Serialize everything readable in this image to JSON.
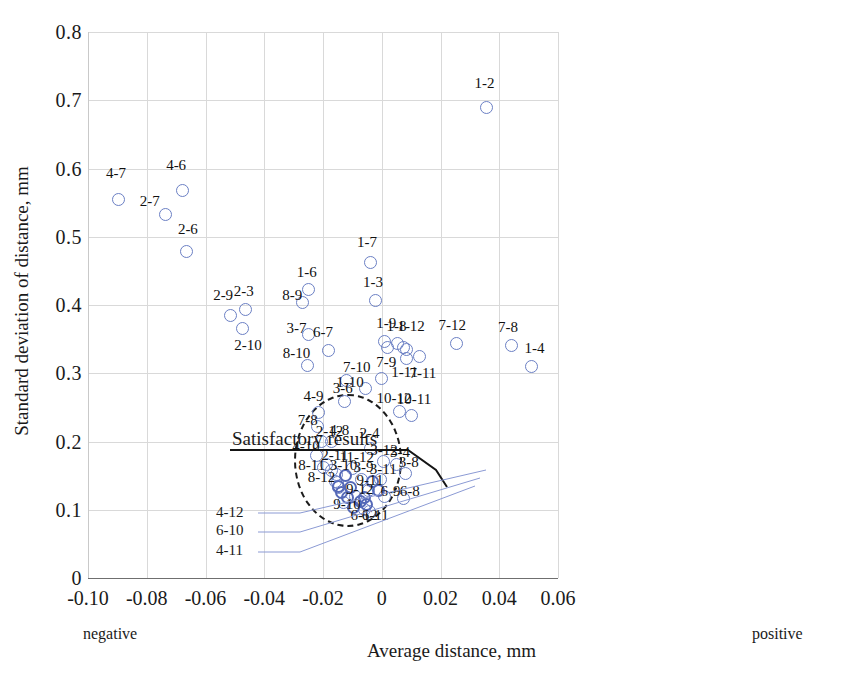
{
  "chart_data": {
    "type": "scatter",
    "title": "",
    "xlabel": "Average distance, mm",
    "ylabel": "Standard deviation of distance, mm",
    "xlim": [
      -0.1,
      0.06
    ],
    "ylim": [
      0,
      0.8
    ],
    "xticks": [
      "-0.10",
      "-0.08",
      "-0.06",
      "-0.04",
      "-0.02",
      "0",
      "0.02",
      "0.04",
      "0.06"
    ],
    "xtick_values": [
      -0.1,
      -0.08,
      -0.06,
      -0.04,
      -0.02,
      0,
      0.02,
      0.04,
      0.06
    ],
    "yticks": [
      "0",
      "0.1",
      "0.2",
      "0.3",
      "0.4",
      "0.5",
      "0.6",
      "0.7",
      "0.8"
    ],
    "ytick_values": [
      0,
      0.1,
      0.2,
      0.3,
      0.4,
      0.5,
      0.6,
      0.7,
      0.8
    ],
    "grid": true,
    "legend": "none",
    "axis_end_labels": {
      "left": "negative",
      "right": "positive"
    },
    "marker": "open-circle",
    "marker_color": "#6b7fc4",
    "annotations": [
      {
        "text": "Satisfactory results",
        "type": "callout-with-leader",
        "target": "dashed-ellipse-region"
      }
    ],
    "region": {
      "shape": "ellipse-dashed",
      "center_x": -0.0115,
      "center_y": 0.172,
      "half_width_x": 0.0185,
      "half_height_y": 0.098
    },
    "points": [
      {
        "label": "4-7",
        "x": -0.0895,
        "y": 0.555,
        "lx": -0.0905,
        "ly": 0.593
      },
      {
        "label": "2-7",
        "x": -0.0735,
        "y": 0.533,
        "lx": -0.079,
        "ly": 0.553
      },
      {
        "label": "4-6",
        "x": -0.068,
        "y": 0.568,
        "lx": -0.07,
        "ly": 0.605
      },
      {
        "label": "2-6",
        "x": -0.0665,
        "y": 0.478,
        "lx": -0.066,
        "ly": 0.512
      },
      {
        "label": "2-9",
        "x": -0.0515,
        "y": 0.385,
        "lx": -0.054,
        "ly": 0.414
      },
      {
        "label": "2-3",
        "x": -0.0465,
        "y": 0.393,
        "lx": -0.047,
        "ly": 0.42
      },
      {
        "label": "2-10",
        "x": -0.0475,
        "y": 0.365,
        "lx": -0.0455,
        "ly": 0.342
      },
      {
        "label": "8-9",
        "x": -0.027,
        "y": 0.403,
        "lx": -0.0305,
        "ly": 0.414
      },
      {
        "label": "1-6",
        "x": -0.025,
        "y": 0.422,
        "lx": -0.0255,
        "ly": 0.449
      },
      {
        "label": "3-7",
        "x": -0.025,
        "y": 0.357,
        "lx": -0.029,
        "ly": 0.366
      },
      {
        "label": "8-10",
        "x": -0.0253,
        "y": 0.311,
        "lx": -0.029,
        "ly": 0.33
      },
      {
        "label": "6-7",
        "x": -0.018,
        "y": 0.333,
        "lx": -0.02,
        "ly": 0.361
      },
      {
        "label": "1-7",
        "x": -0.004,
        "y": 0.463,
        "lx": -0.005,
        "ly": 0.492
      },
      {
        "label": "1-3",
        "x": -0.002,
        "y": 0.407,
        "lx": -0.003,
        "ly": 0.434
      },
      {
        "label": "1-9a",
        "x": 0.001,
        "y": 0.346,
        "lx": 0.0015,
        "ly": 0.373
      },
      {
        "label": "1-9b",
        "x": 0.002,
        "y": 0.338,
        "lx": null,
        "ly": null
      },
      {
        "label": "1-8",
        "x": 0.0055,
        "y": 0.343,
        "lx": 0.005,
        "ly": 0.369
      },
      {
        "label": "1-12",
        "x": 0.0075,
        "y": 0.337,
        "lx": 0.01,
        "ly": 0.369
      },
      {
        "label": "1-12b",
        "x": 0.0085,
        "y": 0.335,
        "lx": null,
        "ly": null
      },
      {
        "label": "7-9",
        "x": 0.0,
        "y": 0.292,
        "lx": 0.0015,
        "ly": 0.317
      },
      {
        "label": "1-11",
        "x": 0.0085,
        "y": 0.322,
        "lx": 0.0078,
        "ly": 0.302
      },
      {
        "label": "7-11",
        "x": 0.013,
        "y": 0.325,
        "lx": 0.014,
        "ly": 0.3
      },
      {
        "label": "7-12",
        "x": 0.0255,
        "y": 0.343,
        "lx": 0.024,
        "ly": 0.37
      },
      {
        "label": "7-8",
        "x": 0.044,
        "y": 0.34,
        "lx": 0.043,
        "ly": 0.368
      },
      {
        "label": "1-4",
        "x": 0.051,
        "y": 0.31,
        "lx": 0.052,
        "ly": 0.337
      },
      {
        "label": "1-2",
        "x": 0.0355,
        "y": 0.69,
        "lx": 0.035,
        "ly": 0.726
      },
      {
        "label": "7-10",
        "x": -0.012,
        "y": 0.289,
        "lx": -0.0085,
        "ly": 0.309
      },
      {
        "label": "1-10",
        "x": -0.0055,
        "y": 0.277,
        "lx": -0.0108,
        "ly": 0.287
      },
      {
        "label": "3-6",
        "x": -0.0128,
        "y": 0.258,
        "lx": -0.0133,
        "ly": 0.279
      },
      {
        "label": "4-9",
        "x": -0.0215,
        "y": 0.243,
        "lx": -0.0232,
        "ly": 0.266
      },
      {
        "label": "10-12",
        "x": 0.006,
        "y": 0.244,
        "lx": 0.0042,
        "ly": 0.264
      },
      {
        "label": "10-11",
        "x": 0.01,
        "y": 0.238,
        "lx": 0.011,
        "ly": 0.262
      },
      {
        "label": "7-8b",
        "x": -0.0218,
        "y": 0.222,
        "lx": -0.0252,
        "ly": 0.231
      },
      {
        "label": "2-12",
        "x": -0.0205,
        "y": 0.2,
        "lx": -0.0178,
        "ly": 0.216
      },
      {
        "label": "4-8",
        "x": -0.0172,
        "y": 0.2,
        "lx": -0.0145,
        "ly": 0.217
      },
      {
        "label": "4-10",
        "x": -0.0222,
        "y": 0.179,
        "lx": -0.0258,
        "ly": 0.193
      },
      {
        "label": "2-11",
        "x": -0.0188,
        "y": 0.166,
        "lx": -0.016,
        "ly": 0.18
      },
      {
        "label": "8-11",
        "x": -0.02,
        "y": 0.162,
        "lx": -0.0238,
        "ly": 0.166
      },
      {
        "label": "3-10",
        "x": -0.017,
        "y": 0.158,
        "lx": -0.013,
        "ly": 0.165
      },
      {
        "label": "11-12",
        "x": -0.01,
        "y": 0.161,
        "lx": -0.0085,
        "ly": 0.178
      },
      {
        "label": "2-4",
        "x": -0.004,
        "y": 0.19,
        "lx": -0.0042,
        "ly": 0.212
      },
      {
        "label": "3-12",
        "x": 0.0005,
        "y": 0.17,
        "lx": 0.0008,
        "ly": 0.187
      },
      {
        "label": "3-4",
        "x": 0.005,
        "y": 0.167,
        "lx": 0.0062,
        "ly": 0.185
      },
      {
        "label": "3-8",
        "x": 0.008,
        "y": 0.153,
        "lx": 0.0092,
        "ly": 0.17
      },
      {
        "label": "3-9",
        "x": -0.0068,
        "y": 0.145,
        "lx": -0.0062,
        "ly": 0.163
      },
      {
        "label": "3-11",
        "x": -0.0005,
        "y": 0.145,
        "lx": 0.0005,
        "ly": 0.159
      },
      {
        "label": "8-12",
        "x": -0.0158,
        "y": 0.142,
        "lx": -0.0205,
        "ly": 0.148
      },
      {
        "label": "9-11",
        "x": -0.0045,
        "y": 0.128,
        "lx": -0.004,
        "ly": 0.144
      },
      {
        "label": "9-12",
        "x": -0.009,
        "y": 0.12,
        "lx": -0.0075,
        "ly": 0.131
      },
      {
        "label": "6-9",
        "x": 0.001,
        "y": 0.12,
        "lx": 0.003,
        "ly": 0.128
      },
      {
        "label": "6-8",
        "x": 0.0075,
        "y": 0.117,
        "lx": 0.0095,
        "ly": 0.127
      },
      {
        "label": "9-10",
        "x": -0.013,
        "y": 0.11,
        "lx": -0.0118,
        "ly": 0.108
      },
      {
        "label": "6-12",
        "x": -0.0058,
        "y": 0.1,
        "lx": -0.006,
        "ly": 0.092
      },
      {
        "label": "6-11",
        "x": -0.0042,
        "y": 0.098,
        "lx": -0.0022,
        "ly": 0.092
      },
      {
        "label": "4-12",
        "x": -0.0155,
        "y": 0.152,
        "lx": null,
        "ly": null
      },
      {
        "label": "6-10",
        "x": -0.015,
        "y": 0.14,
        "lx": null,
        "ly": null
      },
      {
        "label": "4-11",
        "x": -0.0148,
        "y": 0.133,
        "lx": null,
        "ly": null
      },
      {
        "label": "x1",
        "x": -0.0148,
        "y": 0.134,
        "lx": null,
        "ly": null
      },
      {
        "label": "x2",
        "x": -0.0138,
        "y": 0.125,
        "lx": null,
        "ly": null
      },
      {
        "label": "x3",
        "x": -0.0122,
        "y": 0.15,
        "lx": null,
        "ly": null
      },
      {
        "label": "x4",
        "x": -0.0118,
        "y": 0.118,
        "lx": null,
        "ly": null
      },
      {
        "label": "x5",
        "x": -0.0108,
        "y": 0.132,
        "lx": null,
        "ly": null
      },
      {
        "label": "x6",
        "x": -0.0095,
        "y": 0.103,
        "lx": null,
        "ly": null
      },
      {
        "label": "x7",
        "x": -0.0072,
        "y": 0.112,
        "lx": null,
        "ly": null
      },
      {
        "label": "x8",
        "x": -0.006,
        "y": 0.118,
        "lx": null,
        "ly": null
      },
      {
        "label": "x9",
        "x": -0.0052,
        "y": 0.107,
        "lx": null,
        "ly": null
      },
      {
        "label": "x10",
        "x": -0.003,
        "y": 0.142,
        "lx": null,
        "ly": null
      },
      {
        "label": "x11",
        "x": -0.0012,
        "y": 0.128,
        "lx": null,
        "ly": null
      }
    ]
  },
  "labels": {
    "xlabel": "Average distance, mm",
    "ylabel": "Standard deviation of distance, mm",
    "negative": "negative",
    "positive": "positive",
    "satisfactory": "Satisfactory results"
  },
  "leader_labels": [
    {
      "text": "4-12",
      "x": 216,
      "y": 512
    },
    {
      "text": "6-10",
      "x": 216,
      "y": 530
    },
    {
      "text": "4-11",
      "x": 216,
      "y": 550
    }
  ]
}
